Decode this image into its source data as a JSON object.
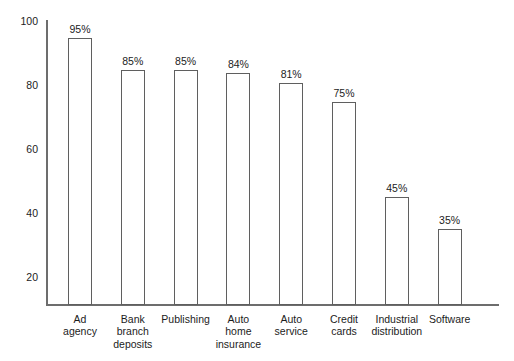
{
  "chart_data": {
    "type": "bar",
    "title": "",
    "subtitle": "",
    "xlabel": "",
    "ylabel": "",
    "ylim": [
      12,
      100
    ],
    "yticks": [
      20,
      40,
      60,
      80,
      100
    ],
    "ytick_labels": [
      "20",
      "40",
      "60",
      "80",
      "100"
    ],
    "grid": false,
    "legend": null,
    "categories": [
      "Ad\nagency",
      "Bank\nbranch\ndeposits",
      "Publishing",
      "Auto\nhome\ninsurance",
      "Auto\nservice",
      "Credit\ncards",
      "Industrial\ndistribution",
      "Software"
    ],
    "values": [
      95,
      85,
      85,
      84,
      81,
      75,
      45,
      35
    ],
    "data_labels": [
      "95%",
      "85%",
      "85%",
      "84%",
      "81%",
      "75%",
      "45%",
      "35%"
    ],
    "bar_style": {
      "fill": "#ffffff",
      "edge": "#5f5f5f"
    },
    "axis_color": "#6d6d6d"
  }
}
